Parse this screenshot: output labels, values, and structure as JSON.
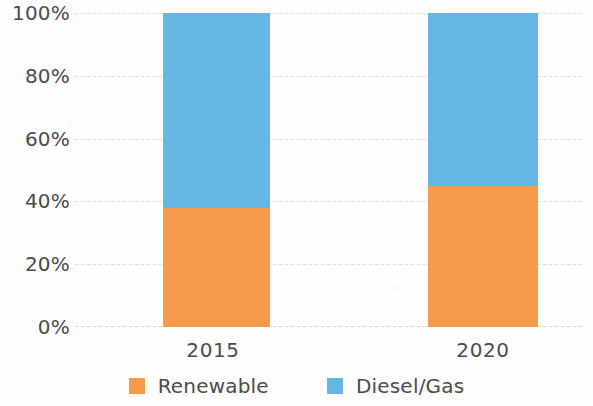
{
  "chart_data": {
    "type": "bar",
    "subtype": "stacked-100",
    "title": "",
    "xlabel": "",
    "ylabel": "",
    "categories": [
      "2015",
      "2020"
    ],
    "series": [
      {
        "name": "Renewable",
        "color": "#F79A4C",
        "values": [
          38,
          45
        ]
      },
      {
        "name": "Diesel/Gas",
        "color": "#65B6E3",
        "values": [
          62,
          55
        ]
      }
    ],
    "ylim": [
      0,
      100
    ],
    "yticks": [
      0,
      20,
      40,
      60,
      80,
      100
    ],
    "ytick_labels": [
      "0%",
      "20%",
      "40%",
      "60%",
      "80%",
      "100%"
    ],
    "grid": true,
    "grid_axis": "y",
    "legend_position": "bottom"
  },
  "axes": {
    "y_ticks": [
      {
        "label": "100%",
        "value": 100
      },
      {
        "label": "80%",
        "value": 80
      },
      {
        "label": "60%",
        "value": 60
      },
      {
        "label": "40%",
        "value": 40
      },
      {
        "label": "20%",
        "value": 20
      },
      {
        "label": "0%",
        "value": 0
      }
    ],
    "x_ticks": [
      {
        "label": "2015"
      },
      {
        "label": "2020"
      }
    ]
  },
  "legend": {
    "items": [
      {
        "label": "Renewable",
        "color": "#F79A4C"
      },
      {
        "label": "Diesel/Gas",
        "color": "#65B6E3"
      }
    ]
  },
  "colors": {
    "renewable": "#F79A4C",
    "diesel_gas": "#65B6E3",
    "text": "#4C4C4C",
    "gridline": "#D8D8D6",
    "background": "#FDFDFC"
  }
}
